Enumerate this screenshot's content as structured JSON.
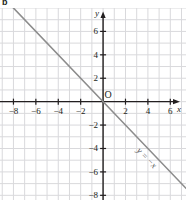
{
  "panel": {
    "letter": "b"
  },
  "chart_data": {
    "type": "line",
    "title": "",
    "subtitle": "",
    "xlabel": "x",
    "ylabel": "y",
    "equation": "y = −x",
    "origin_label": "O",
    "grid": true,
    "grid_step": 1,
    "legend": "none",
    "xlim": [
      -9.2,
      7.4
    ],
    "ylim": [
      -8.4,
      8.0
    ],
    "xticks": [
      -8,
      -6,
      -4,
      -2,
      2,
      4,
      6
    ],
    "xtick_labels": [
      "−8",
      "−6",
      "−4",
      "−2",
      "2",
      "4",
      "6"
    ],
    "yticks": [
      6,
      4,
      2,
      -2,
      -4,
      -6,
      -8
    ],
    "ytick_labels": [
      "6",
      "4",
      "2",
      "−2",
      "−4",
      "−6",
      "−8"
    ],
    "series": [
      {
        "name": "y = −x",
        "slope": -1,
        "intercept": 0,
        "color": "#8c8c8c",
        "x": [
          -9.2,
          7.4
        ],
        "values": [
          9.2,
          -7.4
        ],
        "points": [
          {
            "x": -8,
            "y": 8
          },
          {
            "x": -6,
            "y": 6
          },
          {
            "x": -4,
            "y": 4
          },
          {
            "x": -2,
            "y": 2
          },
          {
            "x": 0,
            "y": 0
          },
          {
            "x": 2,
            "y": -2
          },
          {
            "x": 4,
            "y": -4
          },
          {
            "x": 6,
            "y": -6
          }
        ]
      }
    ],
    "colors": {
      "grid": "#d9d9dc",
      "axis": "#231f20",
      "line": "#8c8c8c",
      "text": "#231f20",
      "background": "#ffffff"
    }
  }
}
